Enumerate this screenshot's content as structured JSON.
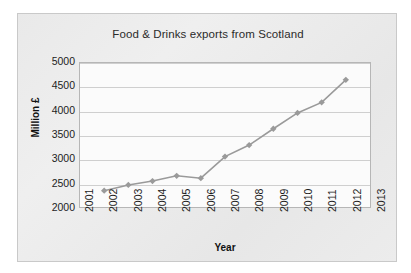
{
  "chart_data": {
    "type": "line",
    "title": "Food & Drinks exports from Scotland",
    "xlabel": "Year",
    "ylabel": "Million £",
    "x": [
      2002,
      2003,
      2004,
      2005,
      2006,
      2007,
      2008,
      2009,
      2010,
      2011,
      2012
    ],
    "values": [
      2340,
      2460,
      2540,
      2650,
      2600,
      3050,
      3290,
      3630,
      3960,
      4180,
      4650
    ],
    "series": [
      {
        "name": "Food & Drinks exports",
        "values": [
          2340,
          2460,
          2540,
          2650,
          2600,
          3050,
          3290,
          3630,
          3960,
          4180,
          4650
        ]
      }
    ],
    "x_tick_labels": [
      "2001",
      "2002",
      "2003",
      "2004",
      "2005",
      "2006",
      "2007",
      "2008",
      "2009",
      "2010",
      "2011",
      "2012",
      "2013"
    ],
    "y_tick_labels": [
      "5000",
      "4500",
      "4000",
      "3500",
      "3000",
      "2500",
      "2000"
    ],
    "y_ticks": [
      5000,
      4500,
      4000,
      3500,
      3000,
      2500,
      2000
    ],
    "xlim": [
      2001,
      2013
    ],
    "ylim": [
      2000,
      5000
    ],
    "grid": "horizontal",
    "legend": "none",
    "marker": "diamond",
    "series_color": "#9a9a9a",
    "line_color": "#9a9a9a",
    "plot_background": "#fbfbfb",
    "chart_background": "#ebebeb",
    "gridline_color": "#cfcfcf",
    "axis_color": "#b6b6b6",
    "text_color": "#1d1d1d"
  }
}
